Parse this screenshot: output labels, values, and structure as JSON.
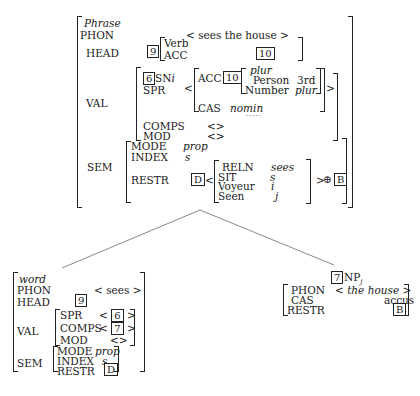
{
  "mother": {
    "type": "Phrase",
    "phon_label": "PHON",
    "phon_value": "< sees the house >",
    "head_label": "HEAD",
    "head_tag": "9",
    "head_type": "Verb",
    "head_acc_label": "ACC",
    "head_acc_tag": "10",
    "val_label": "VAL",
    "spr_tag": "6",
    "spr_np": "SN",
    "spr_np_index": "i",
    "spr_label": "SPR",
    "spr_open": "<",
    "spr_close": ">",
    "spr_acc_label": "ACC",
    "spr_acc_tag": "10",
    "agr_type": "plur",
    "person_label": "Person",
    "person_value": "3rd",
    "number_label": "Number",
    "number_value": "plur",
    "cas_label": "CAS",
    "cas_value": "nomin",
    "comps_label": "COMPS",
    "comps_value": "<>",
    "mod_label": "MOD",
    "mod_value": "<>",
    "sem_label": "SEM",
    "mode_label": "MODE",
    "mode_value": "prop",
    "index_label": "INDEX",
    "index_value": "s",
    "restr_label": "RESTR",
    "restr_tag": "D",
    "restr_open": "<",
    "reln_label": "RELN",
    "reln_value": "sees",
    "sit_label": "SIT",
    "sit_value": "s",
    "voyeur_label": "Voyeur",
    "voyeur_value": "i",
    "seen_label": "Seen",
    "seen_value": "j",
    "restr_close": ">",
    "oplus": "⊕",
    "restr_append_tag": "B"
  },
  "head_daughter": {
    "type": "word",
    "phon_label": "PHON",
    "phon_value": "< sees >",
    "head_label": "HEAD",
    "head_tag": "9",
    "val_label": "VAL",
    "spr_label": "SPR",
    "spr_open": "<",
    "spr_tag": "6",
    "spr_close": ">",
    "comps_label": "COMPS",
    "comps_open": "<",
    "comps_tag": "7",
    "comps_close": ">",
    "mod_label": "MOD",
    "mod_value": "<>",
    "sem_label": "SEM",
    "mode_label": "MODE",
    "mode_value": "prop",
    "index_label": "INDEX",
    "index_value": "s",
    "restr_label": "RESTR",
    "restr_tag": "D"
  },
  "comp_daughter": {
    "tag": "7",
    "category": "NP",
    "index": "j",
    "phon_label": "PHON",
    "phon_value": "< the house >",
    "cas_label": "CAS",
    "cas_value": "accus",
    "restr_label": "RESTR",
    "restr_tag": "B"
  }
}
